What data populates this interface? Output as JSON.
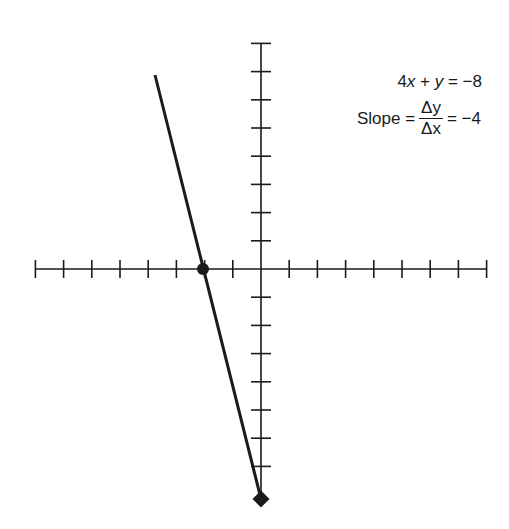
{
  "chart_data": {
    "type": "line",
    "title": "",
    "equation": "4x + y = -8",
    "slope_label": "Slope",
    "slope_num": "Δy",
    "slope_den": "Δx",
    "slope_value": "= −4",
    "slope": -4,
    "intercept_y": -8,
    "intercept_x": -2,
    "xlim": [
      -8,
      8
    ],
    "ylim": [
      -8,
      8
    ],
    "grid": false,
    "axis_ticks_unit": 1,
    "points": [
      {
        "x": -2,
        "y": 0
      },
      {
        "x": 0,
        "y": -8
      }
    ],
    "line": {
      "x_start": -3.75,
      "y_start": 7,
      "x_end": 0,
      "y_end": -8
    },
    "xlabel": "",
    "ylabel": ""
  },
  "labels": {
    "equation_x": "4",
    "equation_rest": " + ",
    "equation_y": "y",
    "equation_rhs": " = −8",
    "slope_prefix": "Slope =",
    "slope_num": "Δy",
    "slope_den": "Δx",
    "slope_value": "= −4"
  }
}
